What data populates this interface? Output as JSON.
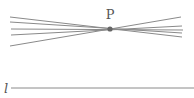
{
  "diagram": {
    "point": {
      "label": "P",
      "x": 110,
      "y": 29,
      "color": "#666666"
    },
    "pencil_lines": [
      {
        "x1": 10,
        "y1": 17,
        "x2": 182,
        "y2": 37
      },
      {
        "x1": 10,
        "y1": 22,
        "x2": 182,
        "y2": 33
      },
      {
        "x1": 11,
        "y1": 29,
        "x2": 183,
        "y2": 30
      },
      {
        "x1": 11,
        "y1": 35,
        "x2": 182,
        "y2": 26
      },
      {
        "x1": 10,
        "y1": 46,
        "x2": 181,
        "y2": 17
      }
    ],
    "line_l": {
      "label": "l",
      "x1": 11,
      "y1": 88,
      "x2": 194,
      "y2": 88
    },
    "stroke_color": "#8a8a8a"
  }
}
